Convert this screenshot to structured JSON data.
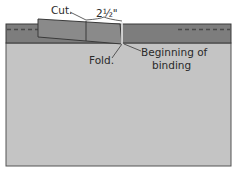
{
  "diagram": {
    "labels": {
      "cut": "Cut.",
      "measurement": "2½\"",
      "fold": "Fold.",
      "beginning_line1": "Beginning of",
      "beginning_line2": "binding"
    },
    "colors": {
      "fabric_light": "#c4c4c4",
      "binding_band": "#7d7d7d",
      "binding_tail": "#8a8a8a",
      "outline": "#3a3a3a",
      "dash": "#4a4a4a",
      "fold_line": "#eeeeee",
      "leader": "#3a3a3a"
    }
  }
}
